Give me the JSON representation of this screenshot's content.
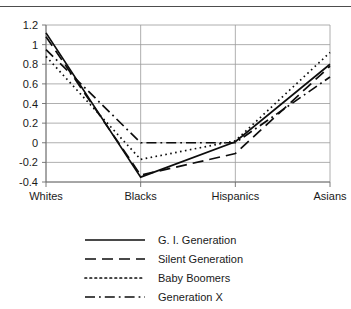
{
  "chart_data": {
    "type": "line",
    "title": "",
    "subtitle": "",
    "xlabel": "",
    "ylabel": "",
    "categories": [
      "Whites",
      "Blacks",
      "Hispanics",
      "Asians"
    ],
    "ylim": [
      -0.4,
      1.2
    ],
    "yticks": [
      -0.4,
      -0.2,
      0,
      0.2,
      0.4,
      0.6,
      0.8,
      1,
      1.2
    ],
    "ytick_labels": [
      "-0.4",
      "-0.2",
      "0",
      "0.2",
      "0.4",
      "0.6",
      "0.8",
      "1",
      "1.2"
    ],
    "grid": true,
    "grid_axis": "y",
    "legend_position": "bottom",
    "series": [
      {
        "name": "G. I. Generation",
        "dash": "solid",
        "values": [
          1.12,
          -0.35,
          0.01,
          0.8
        ]
      },
      {
        "name": "Silent Generation",
        "dash": "dashed",
        "values": [
          1.08,
          -0.33,
          -0.11,
          0.78
        ]
      },
      {
        "name": "Baby Boomers",
        "dash": "dotted",
        "values": [
          0.88,
          -0.17,
          0.02,
          0.92
        ]
      },
      {
        "name": "Generation X",
        "dash": "dashdot",
        "values": [
          0.95,
          0.0,
          0.0,
          0.67
        ]
      }
    ]
  },
  "legend": {
    "entries": [
      {
        "label": "G. I. Generation"
      },
      {
        "label": "Silent Generation"
      },
      {
        "label": "Baby Boomers"
      },
      {
        "label": "Generation X"
      }
    ]
  },
  "axis": {
    "y_tick_labels": [
      "1.2",
      "1",
      "0.8",
      "0.6",
      "0.4",
      "0.2",
      "0",
      "-0.2",
      "-0.4"
    ],
    "x_tick_labels": [
      "Whites",
      "Blacks",
      "Hispanics",
      "Asians"
    ]
  },
  "colors": {
    "ink": "#0d0d0d",
    "grid": "#9a9a9a",
    "axis": "#6b6b6b",
    "rule": "#4d4d4d",
    "background": "#ffffff"
  }
}
